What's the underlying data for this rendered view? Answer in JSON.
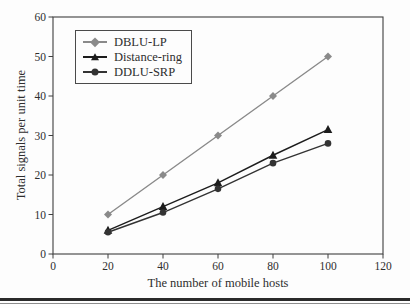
{
  "figure": {
    "background": "#fdfdfd",
    "axis_color": "#3f3f3f",
    "text_color": "#2e2e2e",
    "bottom_rule_color": "#2b2b2b"
  },
  "chart_data": {
    "type": "line",
    "title": "",
    "xlabel": "The number of mobile hosts",
    "ylabel": "Total signals per unit time",
    "xlim": [
      0,
      120
    ],
    "ylim": [
      0,
      60
    ],
    "x_ticks": [
      0,
      20,
      40,
      60,
      80,
      100,
      120
    ],
    "y_ticks": [
      0,
      10,
      20,
      30,
      40,
      50,
      60
    ],
    "grid": false,
    "legend_position": "upper-left-inside",
    "x": [
      20,
      40,
      60,
      80,
      100
    ],
    "series": [
      {
        "name": "DBLU-LP",
        "marker": "diamond",
        "color": "#8a8a8a",
        "values": [
          10,
          20,
          30,
          40,
          50
        ]
      },
      {
        "name": "Distance-ring",
        "marker": "triangle",
        "color": "#1c1c1c",
        "values": [
          6,
          12,
          18,
          25,
          31.5
        ]
      },
      {
        "name": "DDLU-SRP",
        "marker": "circle",
        "color": "#333333",
        "values": [
          5.5,
          10.5,
          16.5,
          23,
          28
        ]
      }
    ]
  }
}
